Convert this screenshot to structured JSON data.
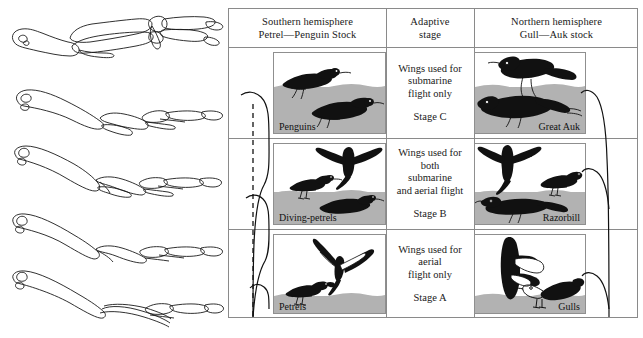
{
  "figure": {
    "caption": ""
  },
  "left_panel": {
    "name": "wing-skeleton-series",
    "description": "Five bird wing skeleton line drawings arranged vertically",
    "items": [
      {
        "index": 1,
        "label": ""
      },
      {
        "index": 2,
        "label": ""
      },
      {
        "index": 3,
        "label": ""
      },
      {
        "index": 4,
        "label": ""
      },
      {
        "index": 5,
        "label": ""
      }
    ]
  },
  "table": {
    "headers": [
      {
        "line1": "Southern hemisphere",
        "line2": "Petrel—Penguin Stock"
      },
      {
        "line1": "Adaptive",
        "line2": "stage"
      },
      {
        "line1": "Northern hemisphere",
        "line2": "Gull—Auk stock"
      }
    ],
    "rows": [
      {
        "stage_desc": "Wings used for\nsubmarine\nflight only",
        "stage_name": "Stage C",
        "left": {
          "label": "Penguins",
          "water_pct": 58
        },
        "right": {
          "label": "Great Auk",
          "water_pct": 58
        }
      },
      {
        "stage_desc": "Wings used for\nboth\nsubmarine\nand aerial flight",
        "stage_name": "Stage B",
        "left": {
          "label": "Diving-petrels",
          "water_pct": 40
        },
        "right": {
          "label": "Razorbill",
          "water_pct": 40
        }
      },
      {
        "stage_desc": "Wings used for\naerial\nflight only",
        "stage_name": "Stage A",
        "left": {
          "label": "Petrels",
          "water_pct": 22
        },
        "right": {
          "label": "Gulls",
          "water_pct": 22
        }
      }
    ]
  },
  "colors": {
    "water": "#b2b2b2",
    "border": "#8a8a8a",
    "ink": "#111111",
    "page": "#ffffff"
  }
}
